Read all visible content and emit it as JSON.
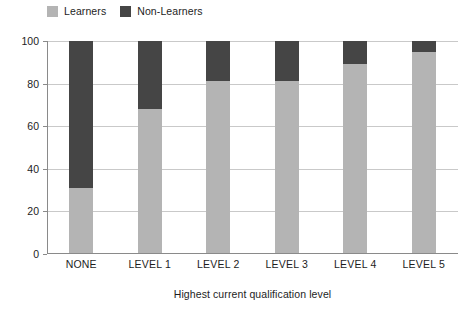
{
  "chart_data": {
    "type": "bar",
    "subtype": "stacked-percentage",
    "title": "",
    "xlabel": "Highest current qualification level",
    "ylabel": "",
    "categories": [
      "NONE",
      "LEVEL 1",
      "LEVEL 2",
      "LEVEL 3",
      "LEVEL 4",
      "LEVEL 5"
    ],
    "series": [
      {
        "name": "Learners",
        "color": "#b4b4b4",
        "values": [
          31,
          68,
          81,
          81,
          89,
          95
        ]
      },
      {
        "name": "Non-Learners",
        "color": "#454545",
        "values": [
          69,
          32,
          19,
          19,
          11,
          5
        ]
      }
    ],
    "ylim": [
      0,
      100
    ],
    "yticks": [
      0,
      20,
      40,
      60,
      80,
      100
    ],
    "ytick_labels": [
      "0",
      "20",
      "40",
      "60",
      "80",
      "100"
    ],
    "grid": true,
    "grid_axis": "y",
    "legend_position": "top-left",
    "legend": [
      "Learners",
      "Non-Learners"
    ]
  },
  "legend": {
    "items": [
      {
        "label": "Learners",
        "swatch_name": "legend-swatch-learners"
      },
      {
        "label": "Non-Learners",
        "swatch_name": "legend-swatch-non-learners"
      }
    ]
  },
  "axes": {
    "x_title": "Highest current qualification level"
  },
  "colors": {
    "learners": "#b4b4b4",
    "non_learners": "#454545",
    "gridline": "#c9c9c9",
    "axis": "#8a8a8a",
    "text": "#1d1d1d",
    "background": "#ffffff"
  }
}
